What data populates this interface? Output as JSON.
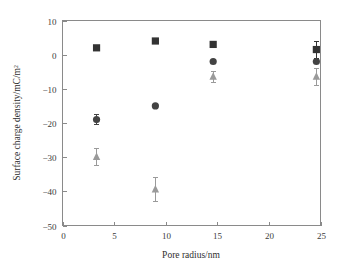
{
  "figure": {
    "width": 349,
    "height": 268,
    "background": "#ffffff"
  },
  "chart_data": {
    "type": "scatter",
    "title": "",
    "xlabel": "Pore radius/nm",
    "ylabel": "Surface charge density/mC/m²",
    "xlim": [
      0,
      25
    ],
    "ylim": [
      -50,
      10
    ],
    "xticks": [
      0,
      5,
      10,
      15,
      20,
      25
    ],
    "yticks": [
      10,
      0,
      -10,
      -20,
      -30,
      -40,
      -50
    ],
    "xtick_labels": [
      "0",
      "5",
      "10",
      "15",
      "20",
      "25"
    ],
    "ytick_labels": [
      "10",
      "0",
      "−10",
      "−20",
      "−30",
      "−40",
      "−50"
    ],
    "grid": false,
    "legend": "none",
    "x": [
      3.3,
      9.0,
      14.6,
      24.6
    ],
    "series": [
      {
        "name": "squares",
        "marker": "square",
        "color": "#333333",
        "values": [
          2.0,
          4.0,
          3.0,
          1.5
        ],
        "errors": [
          0,
          0,
          0,
          2.5
        ]
      },
      {
        "name": "circles",
        "marker": "circle",
        "color": "#434343",
        "values": [
          -19.0,
          -15.0,
          -2.0,
          -2.0
        ],
        "errors": [
          1.5,
          0,
          0,
          0
        ]
      },
      {
        "name": "triangles",
        "marker": "triangle",
        "color": "#9a9a9a",
        "values": [
          -30.0,
          -39.5,
          -6.5,
          -6.5
        ],
        "errors": [
          2.5,
          3.5,
          1.5,
          2.5
        ]
      }
    ]
  },
  "axis_style": {
    "frame_color": "#8a8a8a",
    "tick_color": "#8a8a8a",
    "text_color": "#3b3b3b"
  }
}
